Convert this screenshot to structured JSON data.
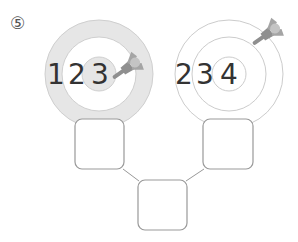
{
  "problem": {
    "number_label": "⑤"
  },
  "targets": [
    {
      "id": "left",
      "digits": [
        "1",
        "2",
        "3"
      ],
      "style": "filled",
      "outer_ring_color": "#e6e6e6",
      "inner_circle_color": "#e6e6e6"
    },
    {
      "id": "right",
      "digits": [
        "2",
        "3",
        "4"
      ],
      "style": "outline",
      "ring_color": "#c8c8c8"
    }
  ],
  "dart": {
    "icon": "dart-icon",
    "color": "#9a9a9a"
  },
  "answer_boxes": [
    {
      "id": "left-box",
      "value": ""
    },
    {
      "id": "right-box",
      "value": ""
    },
    {
      "id": "bottom-box",
      "value": ""
    }
  ]
}
